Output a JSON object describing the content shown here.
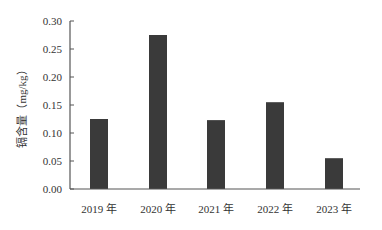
{
  "chart_data": {
    "type": "bar",
    "title": "",
    "xlabel": "",
    "ylabel": "镉含量（mg/kg）",
    "categories": [
      "2019 年",
      "2020 年",
      "2021 年",
      "2022 年",
      "2023 年"
    ],
    "values": [
      0.125,
      0.275,
      0.123,
      0.155,
      0.055
    ],
    "ylim": [
      0,
      0.3
    ],
    "yticks": [
      "0.00",
      "0.05",
      "0.10",
      "0.15",
      "0.20",
      "0.25",
      "0.30"
    ],
    "grid": false,
    "legend": null,
    "bar_color": "#3a3a3a"
  }
}
